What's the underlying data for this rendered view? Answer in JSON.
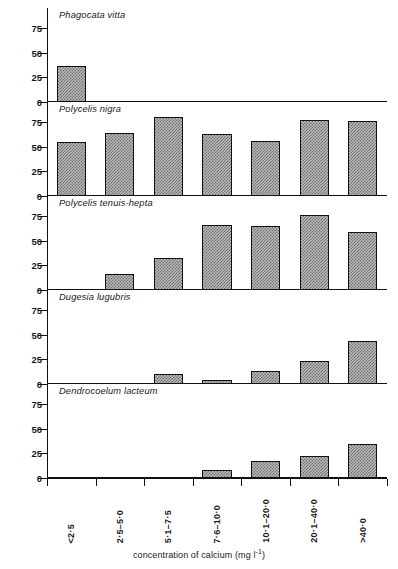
{
  "chart_data": {
    "type": "bar",
    "title": "",
    "xlabel": "concentration of calcium (mg l⁻¹)",
    "ylabel": "percentage occurrence",
    "ylim": [
      0,
      85
    ],
    "yticks": [
      0,
      25,
      50,
      75
    ],
    "grid": false,
    "legend": "none",
    "categories": [
      "<2·5",
      "2·5–5·0",
      "5·1–7·5",
      "7·6–10·0",
      "10·1–20·0",
      "20·1–40·0",
      ">40·0"
    ],
    "panels": [
      {
        "name": "Phagocata vitta",
        "values": [
          36,
          0,
          0,
          0,
          0,
          0,
          0
        ]
      },
      {
        "name": "Polycelis nigra",
        "values": [
          55,
          64,
          80,
          63,
          56,
          77,
          76
        ]
      },
      {
        "name": "Polycelis tenuis-hepta",
        "values": [
          0,
          16,
          32,
          66,
          65,
          76,
          59
        ]
      },
      {
        "name": "Dugesia lugubris",
        "values": [
          0,
          0,
          10,
          4,
          13,
          23,
          44
        ]
      },
      {
        "name": "Dendrocoelum lacteum",
        "values": [
          0,
          0,
          0,
          8,
          17,
          22,
          34
        ]
      }
    ],
    "colors": {
      "axis": "#111111",
      "bar_fill": "#b9b9b9",
      "bar_stipple": "#6f6f6f",
      "bar_outline": "#111111",
      "background": "#ffffff"
    }
  },
  "axis_title_parts": {
    "x_prefix": "concentration of calcium (mg l",
    "x_sup": "-1",
    "x_suffix": ")"
  }
}
